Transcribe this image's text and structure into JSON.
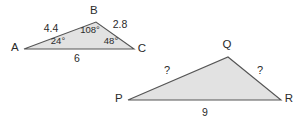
{
  "figure": {
    "background_color": "#ffffff",
    "fill_color": "#e2e2e2",
    "stroke_color": "#555555",
    "text_color": "#2b2b2b",
    "triangles": [
      {
        "id": "triangle-abc",
        "vertices": [
          {
            "name": "A",
            "label": "A",
            "x": 24,
            "y": 49,
            "label_x": 15,
            "label_y": 48
          },
          {
            "name": "B",
            "label": "B",
            "x": 96,
            "y": 22,
            "label_x": 94,
            "label_y": 11
          },
          {
            "name": "C",
            "label": "C",
            "x": 134,
            "y": 49,
            "label_x": 142,
            "label_y": 49
          }
        ],
        "side_labels": [
          {
            "name": "side-ab",
            "text": "4.4",
            "x": 51,
            "y": 28
          },
          {
            "name": "side-bc",
            "text": "2.8",
            "x": 120,
            "y": 24
          },
          {
            "name": "side-ac",
            "text": "6",
            "x": 77,
            "y": 58
          }
        ],
        "angle_labels": [
          {
            "name": "angle-a",
            "text": "24°",
            "x": 58,
            "y": 41
          },
          {
            "name": "angle-b",
            "text": "108°",
            "x": 90,
            "y": 30
          },
          {
            "name": "angle-c",
            "text": "48°",
            "x": 111,
            "y": 41
          }
        ]
      },
      {
        "id": "triangle-pqr",
        "vertices": [
          {
            "name": "P",
            "label": "P",
            "x": 128,
            "y": 100,
            "label_x": 119,
            "label_y": 99
          },
          {
            "name": "Q",
            "label": "Q",
            "x": 228,
            "y": 57,
            "label_x": 227,
            "label_y": 45
          },
          {
            "name": "R",
            "label": "R",
            "x": 281,
            "y": 100,
            "label_x": 289,
            "label_y": 99
          }
        ],
        "side_labels": [
          {
            "name": "side-pq",
            "text": "?",
            "x": 167,
            "y": 70
          },
          {
            "name": "side-qr",
            "text": "?",
            "x": 260,
            "y": 70
          },
          {
            "name": "side-pr",
            "text": "9",
            "x": 205,
            "y": 112
          }
        ],
        "angle_labels": []
      }
    ]
  },
  "chart_data": {
    "type": "diagram",
    "shapes": [
      {
        "label": "ABC",
        "type": "triangle",
        "vertices": [
          "A",
          "B",
          "C"
        ],
        "points": [
          [
            24,
            49
          ],
          [
            96,
            22
          ],
          [
            134,
            49
          ]
        ],
        "sides": [
          {
            "from": "A",
            "to": "B",
            "length": "4.4"
          },
          {
            "from": "B",
            "to": "C",
            "length": "2.8"
          },
          {
            "from": "A",
            "to": "C",
            "length": "6"
          }
        ],
        "angles": [
          {
            "at": "A",
            "measure": "24°"
          },
          {
            "at": "B",
            "measure": "108°"
          },
          {
            "at": "C",
            "measure": "48°"
          }
        ]
      },
      {
        "label": "PQR",
        "type": "triangle",
        "vertices": [
          "P",
          "Q",
          "R"
        ],
        "points": [
          [
            128,
            100
          ],
          [
            228,
            57
          ],
          [
            281,
            100
          ]
        ],
        "sides": [
          {
            "from": "P",
            "to": "Q",
            "length": "?"
          },
          {
            "from": "Q",
            "to": "R",
            "length": "?"
          },
          {
            "from": "P",
            "to": "R",
            "length": "9"
          }
        ],
        "angles": []
      }
    ]
  }
}
